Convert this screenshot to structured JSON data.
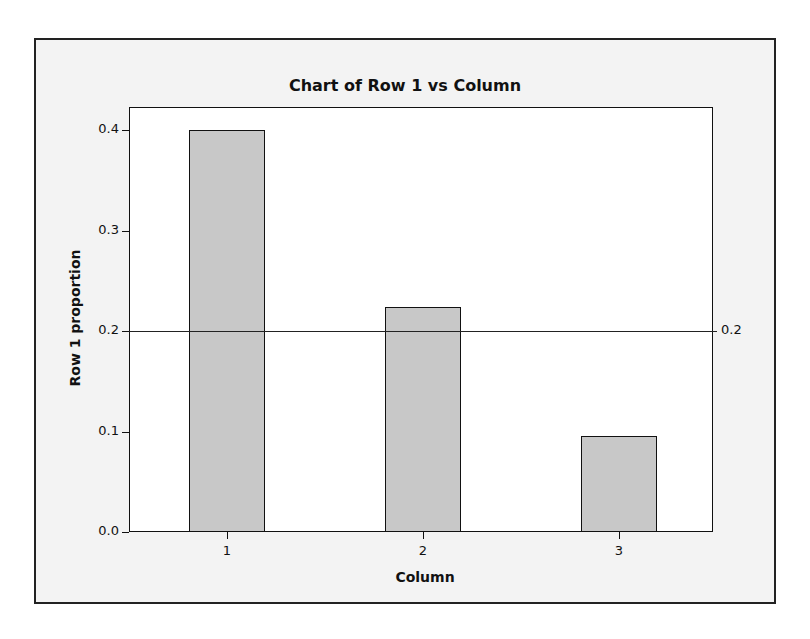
{
  "chart_data": {
    "type": "bar",
    "title": "Chart of Row 1 vs Column",
    "xlabel": "Column",
    "ylabel": "Row 1 proportion",
    "categories": [
      "1",
      "2",
      "3"
    ],
    "values": [
      0.4,
      0.224,
      0.096
    ],
    "ylim": [
      0.0,
      0.42
    ],
    "yticks": [
      "0.0",
      "0.1",
      "0.2",
      "0.3",
      "0.4"
    ],
    "reference_line": {
      "value": 0.2,
      "label": "0.2"
    },
    "grid": false,
    "legend": null
  },
  "colors": {
    "bar_fill": "#c8c8c8",
    "bar_edge": "#111111",
    "frame_bg": "#f3f3f3",
    "plot_bg": "#ffffff"
  }
}
